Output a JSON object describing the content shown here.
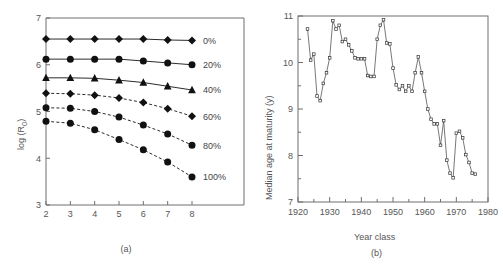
{
  "figure": {
    "panel_a_caption": "(a)",
    "panel_b_caption": "(b)"
  },
  "chart_data": [
    {
      "id": "panel-a",
      "type": "line",
      "title": "",
      "xlabel": "",
      "ylabel": "log (R0)",
      "ylabel_base": "log (R",
      "ylabel_sub": "0",
      "ylabel_close": ")",
      "xlim": [
        2,
        8
      ],
      "ylim": [
        3,
        7
      ],
      "xticks": [
        2,
        3,
        4,
        5,
        6,
        7,
        8
      ],
      "yticks": [
        3,
        4,
        5,
        6,
        7
      ],
      "grid": false,
      "legend_position": "right-inline",
      "x": [
        2,
        3,
        4,
        5,
        6,
        7,
        8
      ],
      "series": [
        {
          "name": "0%",
          "label": "0%",
          "marker": "diamond",
          "line": "solid",
          "values": [
            6.55,
            6.55,
            6.55,
            6.55,
            6.55,
            6.53,
            6.52
          ]
        },
        {
          "name": "20%",
          "label": "20%",
          "marker": "circle",
          "line": "solid",
          "values": [
            6.12,
            6.12,
            6.12,
            6.12,
            6.08,
            6.04,
            6.0
          ]
        },
        {
          "name": "40%",
          "label": "40%",
          "marker": "triangle",
          "line": "solid",
          "values": [
            5.72,
            5.72,
            5.71,
            5.67,
            5.62,
            5.54,
            5.46
          ]
        },
        {
          "name": "60%",
          "label": "60%",
          "marker": "diamond",
          "line": "dashed",
          "values": [
            5.39,
            5.38,
            5.35,
            5.29,
            5.19,
            5.06,
            4.9
          ]
        },
        {
          "name": "80%",
          "label": "80%",
          "marker": "circle",
          "line": "dashed",
          "values": [
            5.08,
            5.07,
            5.0,
            4.88,
            4.71,
            4.52,
            4.28
          ]
        },
        {
          "name": "100%",
          "label": "100%",
          "marker": "circle",
          "line": "dashed",
          "values": [
            4.79,
            4.75,
            4.61,
            4.4,
            4.18,
            3.92,
            3.6
          ]
        }
      ]
    },
    {
      "id": "panel-b",
      "type": "line",
      "title": "",
      "xlabel": "Year class",
      "ylabel": "Median age at maturity (y)",
      "xlim": [
        1920,
        1980
      ],
      "ylim": [
        7,
        11
      ],
      "xticks": [
        1920,
        1930,
        1940,
        1950,
        1960,
        1970,
        1980
      ],
      "yticks": [
        7,
        8,
        9,
        10,
        11
      ],
      "xminor_step": 5,
      "yminor_step": 0.5,
      "grid": false,
      "marker": "open-square",
      "x": [
        1923,
        1924,
        1925,
        1926,
        1927,
        1928,
        1929,
        1930,
        1931,
        1932,
        1933,
        1934,
        1935,
        1936,
        1937,
        1938,
        1939,
        1940,
        1941,
        1942,
        1943,
        1944,
        1945,
        1946,
        1947,
        1948,
        1949,
        1950,
        1951,
        1952,
        1953,
        1954,
        1955,
        1956,
        1957,
        1958,
        1959,
        1960,
        1961,
        1962,
        1963,
        1964,
        1965,
        1966,
        1967,
        1968,
        1969,
        1970,
        1971,
        1972,
        1973,
        1974,
        1975,
        1976
      ],
      "values": [
        10.72,
        10.05,
        10.18,
        9.28,
        9.18,
        9.55,
        9.78,
        10.1,
        10.9,
        10.72,
        10.8,
        10.45,
        10.5,
        10.38,
        10.25,
        10.1,
        10.08,
        10.08,
        10.08,
        9.72,
        9.7,
        9.7,
        10.5,
        10.8,
        10.92,
        10.42,
        10.4,
        9.88,
        9.52,
        9.42,
        9.5,
        9.38,
        9.5,
        9.38,
        9.78,
        10.12,
        9.78,
        9.38,
        9.0,
        8.78,
        8.68,
        8.68,
        8.22,
        8.75,
        7.9,
        7.62,
        7.52,
        8.48,
        8.52,
        8.38,
        8.02,
        7.85,
        7.62,
        7.6
      ]
    }
  ]
}
